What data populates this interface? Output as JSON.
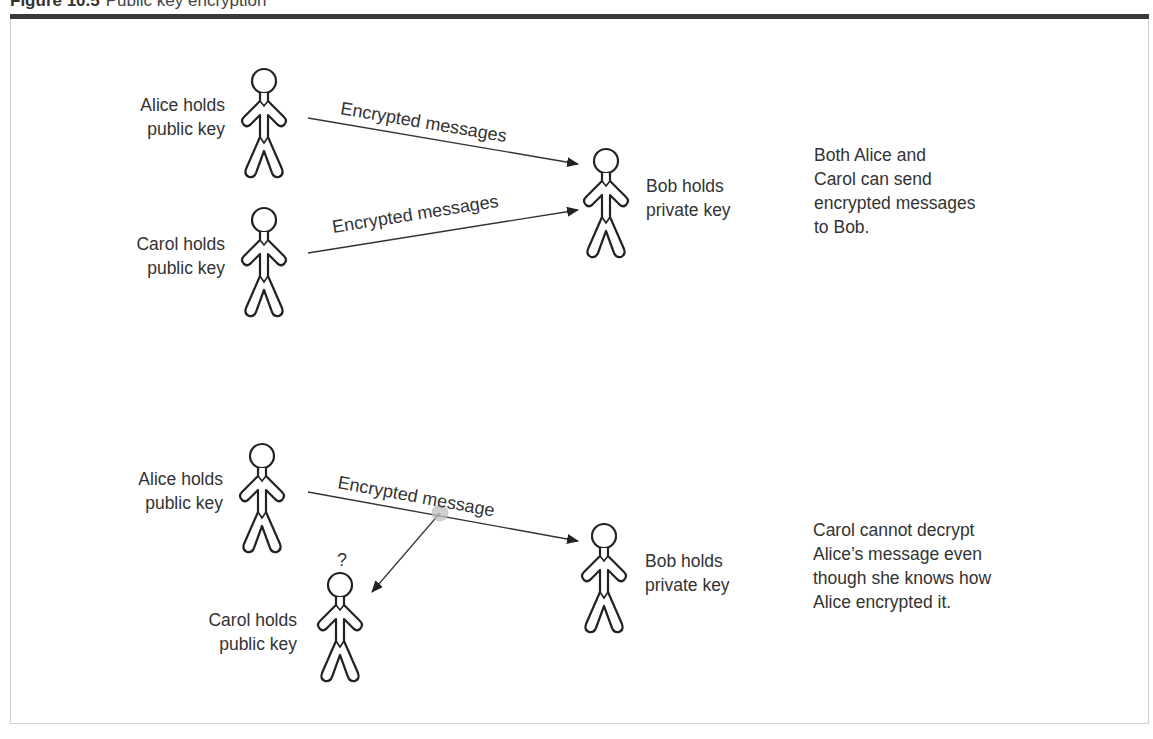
{
  "figure": {
    "number": "Figure 10.5",
    "title": "Public key encryption",
    "colors": {
      "text": "#333333",
      "top_bar": "#3a3a3a",
      "frame_border": "#cfcfcf",
      "figure_stroke": "#222222",
      "intercept_dot": "#bdbdbd"
    }
  },
  "panel_top": {
    "alice": {
      "line1": "Alice holds",
      "line2": "public key"
    },
    "carol": {
      "line1": "Carol holds",
      "line2": "public key"
    },
    "bob": {
      "line1": "Bob holds",
      "line2": "private key"
    },
    "arrow_alice_bob": {
      "label": "Encrypted messages"
    },
    "arrow_carol_bob": {
      "label": "Encrypted messages"
    },
    "note": {
      "line1": "Both Alice and",
      "line2": "Carol can send",
      "line3": "encrypted messages",
      "line4": "to Bob."
    }
  },
  "panel_bottom": {
    "alice": {
      "line1": "Alice holds",
      "line2": "public key"
    },
    "carol": {
      "line1": "Carol holds",
      "line2": "public key"
    },
    "bob": {
      "line1": "Bob holds",
      "line2": "private key"
    },
    "arrow_alice_bob": {
      "label": "Encrypted message"
    },
    "question_mark": "?",
    "note": {
      "line1": "Carol cannot decrypt",
      "line2": "Alice’s message even",
      "line3": "though she knows how",
      "line4": "Alice encrypted it."
    }
  }
}
